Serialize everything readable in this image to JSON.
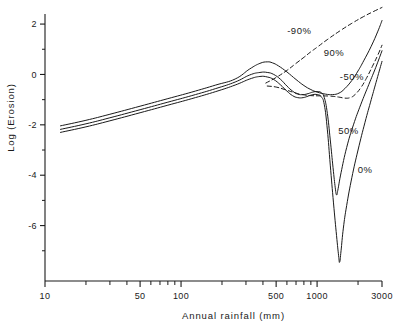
{
  "chart_data": {
    "type": "line",
    "title": "",
    "xlabel": "Annual rainfall (mm)",
    "ylabel": "Log (Erosion)",
    "xscale": "log",
    "yscale": "linear",
    "xlim": [
      10,
      3000
    ],
    "ylim": [
      -8.2,
      2.4
    ],
    "grid": false,
    "legend_position": "inline-annotations",
    "x_ticks_labeled": [
      {
        "value": 10,
        "label": "10"
      },
      {
        "value": 50,
        "label": "50"
      },
      {
        "value": 100,
        "label": "100"
      },
      {
        "value": 500,
        "label": "500"
      },
      {
        "value": 1000,
        "label": "1000"
      },
      {
        "value": 3000,
        "label": "3000"
      }
    ],
    "x_ticks_minor": [
      20,
      30,
      40,
      60,
      70,
      80,
      90,
      200,
      300,
      400,
      600,
      700,
      800,
      900,
      2000
    ],
    "y_ticks_labeled": [
      {
        "value": 2,
        "label": "2"
      },
      {
        "value": 0,
        "label": "0"
      },
      {
        "value": -2,
        "label": "-2"
      },
      {
        "value": -4,
        "label": "-4"
      },
      {
        "value": -6,
        "label": "-6"
      }
    ],
    "y_ticks_minor": [
      1,
      -1,
      -3,
      -5,
      -7
    ],
    "annotations": [
      {
        "text": "-90%",
        "x": 740,
        "y": 1.62,
        "style": "dashed-series"
      },
      {
        "text": "90%",
        "x": 1330,
        "y": 0.72,
        "style": "solid-series"
      },
      {
        "text": "-50%",
        "x": 1800,
        "y": -0.22,
        "style": "dashed-series"
      },
      {
        "text": "50%",
        "x": 1700,
        "y": -2.35,
        "style": "solid-series"
      },
      {
        "text": "0%",
        "x": 2250,
        "y": -3.9,
        "style": "solid-series"
      }
    ],
    "series": [
      {
        "name": "-90%",
        "label": "-90%",
        "linestyle": "dashed",
        "color": "#1a1a1a",
        "points": [
          [
            420,
            -0.34
          ],
          [
            500,
            -0.12
          ],
          [
            600,
            0.16
          ],
          [
            700,
            0.44
          ],
          [
            800,
            0.68
          ],
          [
            900,
            0.9
          ],
          [
            1000,
            1.08
          ],
          [
            1200,
            1.4
          ],
          [
            1500,
            1.76
          ],
          [
            1800,
            2.03
          ],
          [
            2200,
            2.3
          ],
          [
            2600,
            2.5
          ],
          [
            3000,
            2.66
          ]
        ]
      },
      {
        "name": "90%",
        "label": "90%",
        "linestyle": "solid",
        "color": "#1a1a1a",
        "points": [
          [
            13,
            -2.04
          ],
          [
            20,
            -1.82
          ],
          [
            30,
            -1.58
          ],
          [
            50,
            -1.26
          ],
          [
            80,
            -0.96
          ],
          [
            120,
            -0.7
          ],
          [
            180,
            -0.42
          ],
          [
            250,
            -0.18
          ],
          [
            320,
            0.22
          ],
          [
            380,
            0.44
          ],
          [
            430,
            0.5
          ],
          [
            470,
            0.46
          ],
          [
            520,
            0.34
          ],
          [
            600,
            0.1
          ],
          [
            700,
            -0.2
          ],
          [
            800,
            -0.44
          ],
          [
            900,
            -0.6
          ],
          [
            1000,
            -0.7
          ],
          [
            1150,
            -0.78
          ],
          [
            1300,
            -0.8
          ],
          [
            1450,
            -0.74
          ],
          [
            1600,
            -0.56
          ],
          [
            1800,
            -0.24
          ],
          [
            2000,
            0.14
          ],
          [
            2200,
            0.54
          ],
          [
            2500,
            1.12
          ],
          [
            2800,
            1.72
          ],
          [
            3000,
            2.14
          ]
        ]
      },
      {
        "name": "-50%",
        "label": "-50%",
        "linestyle": "dashed",
        "color": "#1a1a1a",
        "points": [
          [
            430,
            -0.46
          ],
          [
            500,
            -0.5
          ],
          [
            580,
            -0.6
          ],
          [
            680,
            -0.72
          ],
          [
            780,
            -0.8
          ],
          [
            900,
            -0.84
          ],
          [
            1050,
            -0.85
          ],
          [
            1250,
            -0.86
          ],
          [
            1450,
            -0.9
          ],
          [
            1600,
            -0.94
          ],
          [
            1750,
            -0.92
          ],
          [
            1900,
            -0.8
          ],
          [
            2100,
            -0.52
          ],
          [
            2300,
            -0.16
          ],
          [
            2550,
            0.32
          ],
          [
            2800,
            0.78
          ],
          [
            3000,
            1.16
          ]
        ]
      },
      {
        "name": "50%",
        "label": "50%",
        "linestyle": "solid",
        "color": "#1a1a1a",
        "points": [
          [
            13,
            -2.18
          ],
          [
            20,
            -1.96
          ],
          [
            30,
            -1.72
          ],
          [
            50,
            -1.4
          ],
          [
            80,
            -1.1
          ],
          [
            120,
            -0.84
          ],
          [
            180,
            -0.56
          ],
          [
            250,
            -0.3
          ],
          [
            320,
            -0.02
          ],
          [
            380,
            0.08
          ],
          [
            430,
            0.08
          ],
          [
            480,
            0.0
          ],
          [
            540,
            -0.2
          ],
          [
            600,
            -0.46
          ],
          [
            660,
            -0.66
          ],
          [
            720,
            -0.78
          ],
          [
            790,
            -0.8
          ],
          [
            860,
            -0.76
          ],
          [
            930,
            -0.7
          ],
          [
            1000,
            -0.68
          ],
          [
            1070,
            -0.72
          ],
          [
            1130,
            -0.92
          ],
          [
            1190,
            -1.55
          ],
          [
            1250,
            -2.6
          ],
          [
            1310,
            -3.7
          ],
          [
            1360,
            -4.5
          ],
          [
            1390,
            -4.78
          ],
          [
            1420,
            -4.6
          ],
          [
            1500,
            -3.9
          ],
          [
            1650,
            -2.9
          ],
          [
            1850,
            -2.0
          ],
          [
            2100,
            -1.18
          ],
          [
            2400,
            -0.4
          ],
          [
            2700,
            0.28
          ],
          [
            3000,
            0.94
          ]
        ]
      },
      {
        "name": "0%",
        "label": "0%",
        "linestyle": "solid",
        "color": "#1a1a1a",
        "points": [
          [
            13,
            -2.3
          ],
          [
            20,
            -2.08
          ],
          [
            30,
            -1.84
          ],
          [
            50,
            -1.52
          ],
          [
            80,
            -1.22
          ],
          [
            120,
            -0.96
          ],
          [
            180,
            -0.68
          ],
          [
            250,
            -0.42
          ],
          [
            320,
            -0.18
          ],
          [
            380,
            -0.08
          ],
          [
            430,
            -0.1
          ],
          [
            480,
            -0.2
          ],
          [
            540,
            -0.42
          ],
          [
            600,
            -0.66
          ],
          [
            660,
            -0.84
          ],
          [
            720,
            -0.92
          ],
          [
            790,
            -0.92
          ],
          [
            860,
            -0.86
          ],
          [
            930,
            -0.8
          ],
          [
            1000,
            -0.8
          ],
          [
            1070,
            -0.88
          ],
          [
            1130,
            -1.2
          ],
          [
            1190,
            -2.2
          ],
          [
            1250,
            -3.6
          ],
          [
            1320,
            -5.1
          ],
          [
            1390,
            -6.4
          ],
          [
            1440,
            -7.2
          ],
          [
            1465,
            -7.45
          ],
          [
            1500,
            -7.0
          ],
          [
            1560,
            -6.1
          ],
          [
            1650,
            -5.2
          ],
          [
            1800,
            -4.1
          ],
          [
            2000,
            -3.0
          ],
          [
            2250,
            -1.9
          ],
          [
            2500,
            -1.0
          ],
          [
            2750,
            -0.2
          ],
          [
            3000,
            0.52
          ]
        ]
      }
    ]
  },
  "axes": {
    "y_axis_title": "Log (Erosion)",
    "x_axis_title": "Annual rainfall (mm)"
  }
}
